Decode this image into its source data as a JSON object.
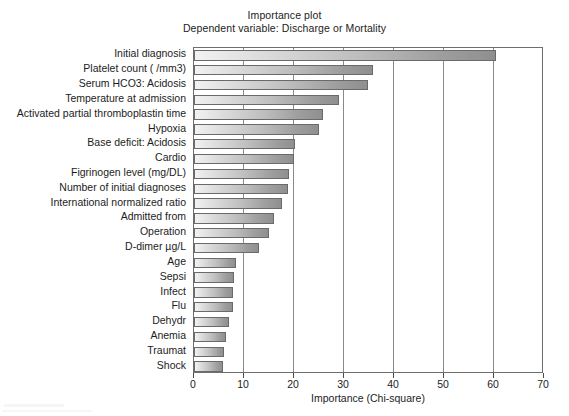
{
  "chart_data": {
    "type": "bar",
    "orientation": "horizontal",
    "title": "Importance plot",
    "subtitle": "Dependent variable: Discharge or Mortality",
    "xlabel": "Importance (Chi-square)",
    "ylabel": "",
    "xlim": [
      0,
      70
    ],
    "xticks": [
      0,
      10,
      20,
      30,
      40,
      50,
      60,
      70
    ],
    "grid": true,
    "grid_axis": "x",
    "legend": "none",
    "bar_color": "#bdbdbd",
    "bar_edge_color": "#6a6a6a",
    "categories": [
      "Initial diagnosis",
      "Platelet count ( /mm3)",
      "Serum HCO3: Acidosis",
      "Temperature at admission",
      "Activated partial thromboplastin time",
      "Hypoxia",
      "Base deficit: Acidosis",
      "Cardio",
      "Figrinogen level (mg/DL)",
      "Number of initial diagnoses",
      "International normalized ratio",
      "Admitted from",
      "Operation",
      "D-dimer µg/L",
      "Age",
      "Sepsi",
      "Infect",
      "Flu",
      "Dehydr",
      "Anemia",
      "Traumat",
      "Shock"
    ],
    "values": [
      60.4,
      35.8,
      34.8,
      29.0,
      25.8,
      25.0,
      20.2,
      19.9,
      19.0,
      18.8,
      17.5,
      16.0,
      15.0,
      13.0,
      8.4,
      7.9,
      7.8,
      7.8,
      7.0,
      6.4,
      5.9,
      5.8
    ]
  },
  "axis": {
    "x_tick_labels": [
      "0",
      "10",
      "20",
      "30",
      "40",
      "50",
      "60",
      "70"
    ],
    "x_title": "Importance (Chi-square)"
  }
}
